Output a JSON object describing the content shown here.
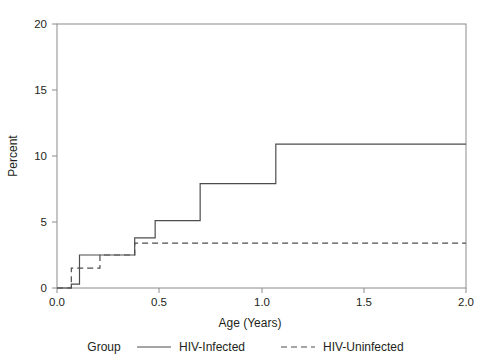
{
  "chart_data": {
    "type": "line",
    "step": "post",
    "title": "",
    "xlabel": "Age (Years)",
    "ylabel": "Percent",
    "xlim": [
      0.0,
      2.0
    ],
    "ylim": [
      0,
      20
    ],
    "xticks": [
      0.0,
      0.5,
      1.0,
      1.5,
      2.0
    ],
    "xtick_labels": [
      "0.0",
      "0.5",
      "1.0",
      "1.5",
      "2.0"
    ],
    "yticks": [
      0,
      5,
      10,
      15,
      20
    ],
    "ytick_labels": [
      "0",
      "5",
      "10",
      "15",
      "20"
    ],
    "grid": false,
    "legend_position": "below",
    "legend_title": "Group",
    "series": [
      {
        "name": "HIV-Infected",
        "style": "solid",
        "color": "#4d4d4d",
        "x": [
          0.0,
          0.07,
          0.11,
          0.21,
          0.38,
          0.48,
          0.7,
          0.96,
          1.07,
          2.0
        ],
        "y": [
          0.0,
          0.3,
          2.5,
          2.5,
          3.8,
          5.1,
          7.9,
          7.9,
          10.9,
          10.9
        ]
      },
      {
        "name": "HIV-Uninfected",
        "style": "dashed",
        "color": "#4d4d4d",
        "x": [
          0.0,
          0.07,
          0.11,
          0.21,
          0.38,
          2.0
        ],
        "y": [
          0.0,
          1.5,
          1.5,
          2.5,
          3.4,
          3.4
        ]
      }
    ]
  },
  "axes": {
    "y_axis_title": "Percent",
    "x_axis_title": "Age (Years)"
  },
  "legend": {
    "group_label": "Group",
    "entries": [
      {
        "label": "HIV-Infected",
        "style": "solid"
      },
      {
        "label": "HIV-Uninfected",
        "style": "dashed"
      }
    ]
  },
  "colors": {
    "line": "#4d4d4d",
    "frame": "#808080",
    "text": "#231f20",
    "background": "#ffffff"
  }
}
